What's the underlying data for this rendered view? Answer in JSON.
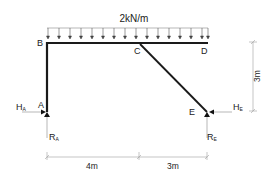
{
  "diagram": {
    "type": "structural-frame",
    "load": {
      "label": "2kN/m",
      "arrow_count": 17
    },
    "nodes": {
      "A": {
        "label": "A"
      },
      "B": {
        "label": "B"
      },
      "C": {
        "label": "C"
      },
      "D": {
        "label": "D"
      },
      "E": {
        "label": "E"
      }
    },
    "reactions": {
      "HA": {
        "main": "H",
        "sub": "A"
      },
      "RA": {
        "main": "R",
        "sub": "A"
      },
      "HE": {
        "main": "H",
        "sub": "E"
      },
      "RE": {
        "main": "R",
        "sub": "E"
      }
    },
    "dimensions": {
      "horizontal_1": "4m",
      "horizontal_2": "3m",
      "vertical": "3m"
    },
    "colors": {
      "member": "#1a1a1a",
      "dimension": "#9a9a9a",
      "text": "#222222"
    }
  }
}
